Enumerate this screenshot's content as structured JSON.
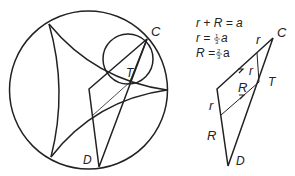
{
  "left_figure": {
    "labels": {
      "C": "C",
      "T": "T",
      "D": "D"
    }
  },
  "right_figure": {
    "equations": {
      "eq1": "r + R = a",
      "eq2_lhs": "r = ",
      "eq2_num": "1",
      "eq2_den": "3",
      "eq2_var": "a",
      "eq3_lhs": "R = ",
      "eq3_num": "2",
      "eq3_den": "3",
      "eq3_var": "a"
    },
    "labels": {
      "C": "C",
      "T": "T",
      "D": "D",
      "r_top": "r",
      "r_inner": "r",
      "R_inner": "R",
      "r_left": "r",
      "R_left": "R"
    }
  },
  "colors": {
    "stroke": "#222222",
    "background": "#ffffff"
  }
}
